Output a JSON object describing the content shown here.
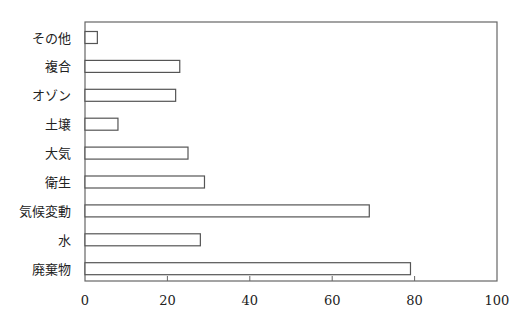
{
  "chart_data": {
    "type": "bar",
    "orientation": "horizontal",
    "title": "",
    "xlabel": "",
    "ylabel": "",
    "categories": [
      "その他",
      "複合",
      "オゾン",
      "土壌",
      "大気",
      "衛生",
      "気候変動",
      "水",
      "廃棄物"
    ],
    "values": [
      3,
      23,
      22,
      8,
      25,
      29,
      69,
      28,
      79
    ],
    "xlim": [
      0,
      100
    ],
    "xticks": [
      0,
      20,
      40,
      60,
      80,
      100
    ],
    "grid": false,
    "legend": null,
    "bar_fill": "#ffffff",
    "bar_stroke": "#555555"
  }
}
